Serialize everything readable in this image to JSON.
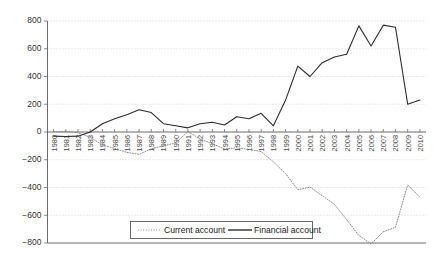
{
  "chart_data": {
    "type": "line",
    "title": "",
    "xlabel": "",
    "ylabel": "",
    "ylim": [
      -800,
      800
    ],
    "yticks": [
      800,
      600,
      400,
      200,
      0,
      -200,
      -400,
      -600,
      -800
    ],
    "ytick_labels": [
      "800",
      "600",
      "400",
      "200",
      "0",
      "−200",
      "−400",
      "−600",
      "−800"
    ],
    "grid": true,
    "legend_position": "bottom-center",
    "categories": [
      "1980",
      "1981",
      "1982",
      "1983",
      "1984",
      "1985",
      "1986",
      "1987",
      "1988",
      "1989",
      "1990",
      "1991",
      "1992",
      "1993",
      "1994",
      "1995",
      "1996",
      "1997",
      "1998",
      "1999",
      "2000",
      "2001",
      "2002",
      "2003",
      "2004",
      "2005",
      "2006",
      "2007",
      "2008",
      "2009",
      "2010"
    ],
    "series": [
      {
        "name": "Current account",
        "style": "dotted",
        "color": "#8c8c8c",
        "values": [
          2,
          5,
          -5,
          -38,
          -94,
          -118,
          -147,
          -161,
          -121,
          -99,
          -79,
          3,
          -50,
          -85,
          -122,
          -114,
          -125,
          -141,
          -215,
          -301,
          -416,
          -397,
          -459,
          -521,
          -631,
          -745,
          -807,
          -719,
          -687,
          -381,
          -470
        ]
      },
      {
        "name": "Financial account",
        "style": "solid",
        "color": "#2b2b2b",
        "values": [
          -30,
          -32,
          -30,
          0,
          60,
          95,
          125,
          160,
          140,
          60,
          45,
          30,
          60,
          70,
          50,
          110,
          95,
          135,
          45,
          230,
          475,
          400,
          500,
          540,
          560,
          765,
          620,
          770,
          755,
          200,
          230
        ]
      }
    ]
  },
  "legend": {
    "entries": [
      {
        "label": "Current account",
        "style": "dotted"
      },
      {
        "label": "Financial account",
        "style": "solid"
      }
    ]
  }
}
